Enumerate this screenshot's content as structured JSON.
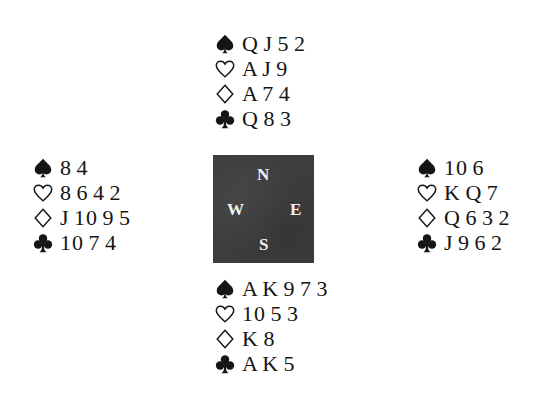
{
  "deal": {
    "north": {
      "spades": "Q J 5 2",
      "hearts": "A J 9",
      "diamonds": "A 7 4",
      "clubs": "Q 8 3"
    },
    "west": {
      "spades": "8 4",
      "hearts": "8 6 4 2",
      "diamonds": "J 10 9 5",
      "clubs": "10 7 4"
    },
    "east": {
      "spades": "10 6",
      "hearts": "K Q 7",
      "diamonds": "Q 6 3 2",
      "clubs": "J 9 6 2"
    },
    "south": {
      "spades": "A K 9 7 3",
      "hearts": "10 5 3",
      "diamonds": "K 8",
      "clubs": "A K 5"
    }
  },
  "compass": {
    "north": "N",
    "west": "W",
    "east": "E",
    "south": "S",
    "background": "#3d3d3d"
  },
  "suit_icons": [
    "spade-icon",
    "heart-icon",
    "diamond-icon",
    "club-icon"
  ]
}
